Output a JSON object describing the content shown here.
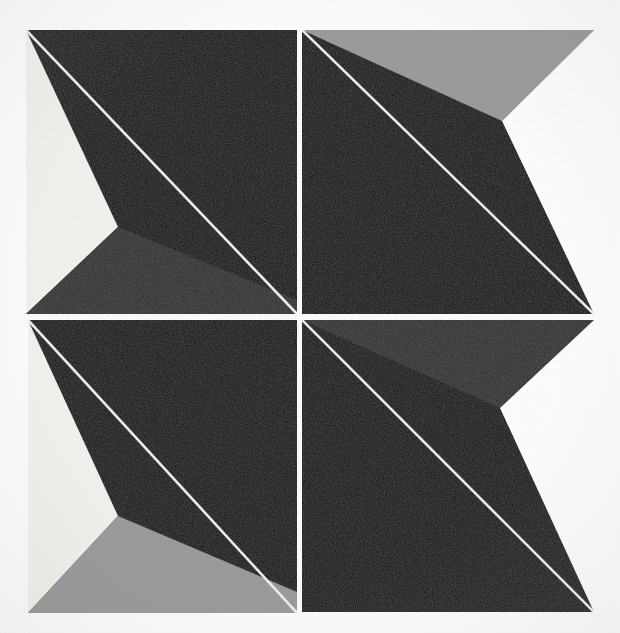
{
  "artwork": {
    "title": "Four Panel Geometric Composition",
    "medium_note": "Four square panels, each bisected by a thin light diagonal",
    "background_color": "#fdfdfc",
    "panel_divider_color": "#fbfbfa",
    "diagonal_line_color": "#efeeea",
    "black_color": "#0a0a0a",
    "dark_gray_color": "#2e2e2e",
    "mid_gray_color": "#9a9a9a",
    "light_color": "#f4f3ef",
    "white_color": "#ffffff",
    "frame": {
      "left": 26,
      "top": 30,
      "right": 594,
      "bottom": 613,
      "center_x": 299,
      "center_y": 317,
      "divider_width": 5
    },
    "panels": [
      {
        "id": "panel-top-left",
        "label": "Top Left Panel",
        "position": "top-left",
        "bounds": {
          "x0": 26,
          "y0": 30,
          "x1": 297,
          "y1": 314
        },
        "vertex": {
          "x": 118,
          "y": 227
        },
        "left_wedge_color": "#f4f3ef",
        "bottom_wedge_color": "#2e2e2e",
        "field_color": "#0a0a0a",
        "diagonal_from": "top-left",
        "diagonal_to": "bottom-right"
      },
      {
        "id": "panel-top-right",
        "label": "Top Right Panel",
        "position": "top-right",
        "bounds": {
          "x0": 302,
          "y0": 30,
          "x1": 594,
          "y1": 314
        },
        "vertex": {
          "x": 502,
          "y": 121
        },
        "top_wedge_color": "#9a9a9a",
        "right_wedge_color": "#ffffff",
        "field_color": "#0a0a0a",
        "diagonal_from": "top-left",
        "diagonal_to": "bottom-right"
      },
      {
        "id": "panel-bottom-left",
        "label": "Bottom Left Panel",
        "position": "bottom-left",
        "bounds": {
          "x0": 28,
          "y0": 320,
          "x1": 297,
          "y1": 613
        },
        "vertex": {
          "x": 118,
          "y": 516
        },
        "left_wedge_color": "#f4f3ef",
        "bottom_wedge_color": "#999999",
        "field_color": "#0a0a0a",
        "diagonal_from": "top-left",
        "diagonal_to": "bottom-right"
      },
      {
        "id": "panel-bottom-right",
        "label": "Bottom Right Panel",
        "position": "bottom-right",
        "bounds": {
          "x0": 302,
          "y0": 320,
          "x1": 594,
          "y1": 612
        },
        "vertex": {
          "x": 500,
          "y": 408
        },
        "top_wedge_color": "#2e2e2e",
        "right_wedge_color": "#ffffff",
        "field_color": "#0a0a0a",
        "diagonal_from": "top-left",
        "diagonal_to": "bottom-right"
      }
    ]
  }
}
